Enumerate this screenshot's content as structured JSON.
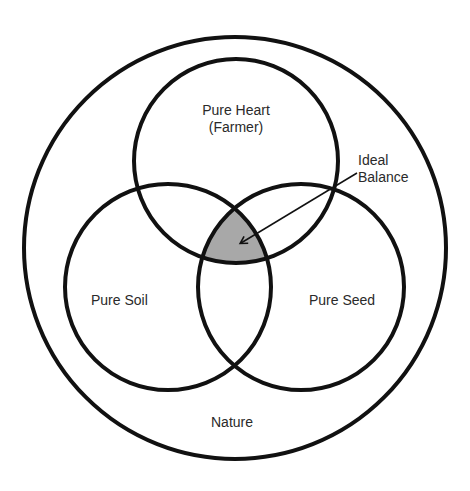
{
  "diagram": {
    "type": "venn",
    "colors": {
      "stroke": "#111111",
      "fill_intersection": "#a8a8a8",
      "background": "#ffffff"
    },
    "sets": [
      {
        "id": "nature",
        "label": "Nature"
      },
      {
        "id": "heart",
        "label_line1": "Pure Heart",
        "label_line2": "(Farmer)"
      },
      {
        "id": "soil",
        "label": "Pure Soil"
      },
      {
        "id": "seed",
        "label": "Pure Seed"
      }
    ],
    "annotation": {
      "label_line1": "Ideal",
      "label_line2": "Balance",
      "points_to": "intersection of heart, soil, seed"
    }
  }
}
